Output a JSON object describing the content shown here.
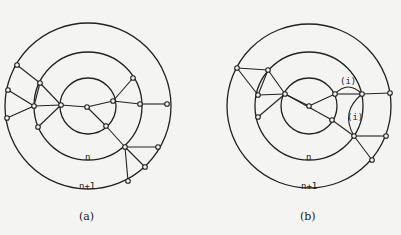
{
  "figure": {
    "panels": [
      {
        "id": "a",
        "caption": "(a)",
        "ring_labels": {
          "inner_ring": "n",
          "outer_ring": "n+1"
        },
        "circles": [
          {
            "cx": 88,
            "cy": 106,
            "r": 83
          },
          {
            "cx": 88,
            "cy": 106,
            "r": 54
          },
          {
            "cx": 88,
            "cy": 106,
            "r": 28
          }
        ]
      },
      {
        "id": "b",
        "caption": "(b)",
        "ring_labels": {
          "inner_ring": "n",
          "outer_ring": "n+1"
        },
        "loop_labels": [
          "(i)",
          "(i)"
        ],
        "circles": [
          {
            "cx": 309,
            "cy": 106,
            "r": 82
          },
          {
            "cx": 309,
            "cy": 106,
            "r": 54
          },
          {
            "cx": 309,
            "cy": 106,
            "r": 28
          }
        ]
      }
    ]
  }
}
